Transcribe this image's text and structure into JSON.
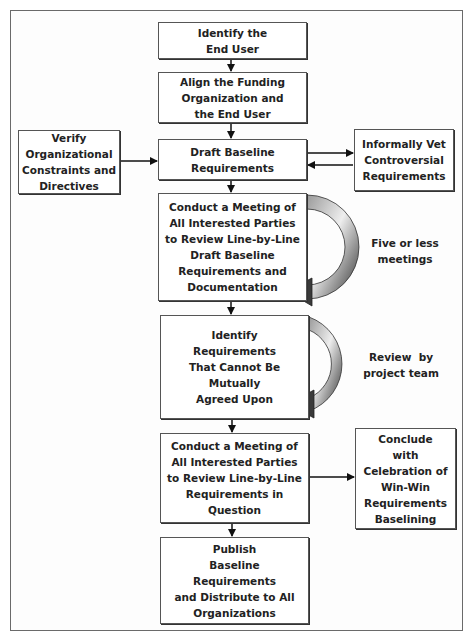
{
  "diagram": {
    "type": "flowchart",
    "main_steps": [
      {
        "id": "identify-end-user",
        "lines": [
          "Identify the",
          "End User"
        ]
      },
      {
        "id": "align-funding",
        "lines": [
          "Align the Funding",
          "Organization and",
          "the End User"
        ]
      },
      {
        "id": "draft-baseline",
        "lines": [
          "Draft Baseline",
          "Requirements"
        ]
      },
      {
        "id": "conduct-meeting-review",
        "lines": [
          "Conduct a Meeting of",
          "All Interested Parties",
          "to Review Line-by-Line",
          "Draft Baseline",
          "Requirements and",
          "Documentation"
        ]
      },
      {
        "id": "identify-disagreements",
        "lines": [
          "Identify",
          "Requirements",
          "That Cannot Be",
          "Mutually",
          "Agreed Upon"
        ]
      },
      {
        "id": "conduct-meeting-question",
        "lines": [
          "Conduct a Meeting of",
          "All Interested Parties",
          "to Review Line-by-Line",
          "Requirements in",
          "Question"
        ]
      },
      {
        "id": "publish-baseline",
        "lines": [
          "Publish",
          "Baseline",
          "Requirements",
          "and Distribute to All",
          "Organizations"
        ]
      }
    ],
    "side_steps": [
      {
        "id": "verify-constraints",
        "lines": [
          "Verify",
          "Organizational",
          "Constraints and",
          "Directives"
        ],
        "connects_to": "draft-baseline",
        "direction": "into"
      },
      {
        "id": "informally-vet",
        "lines": [
          "Informally Vet",
          "Controversial",
          "Requirements"
        ],
        "connects_to": "draft-baseline",
        "direction": "bidirectional"
      },
      {
        "id": "conclude-celebration",
        "lines": [
          "Conclude",
          "with",
          "Celebration of",
          "Win-Win",
          "Requirements",
          "Baselining"
        ],
        "connects_from": "conduct-meeting-question",
        "direction": "out"
      }
    ],
    "loop_notes": [
      {
        "id": "five-or-less",
        "lines": [
          "Five or less",
          "meetings"
        ],
        "attached_to": "conduct-meeting-review"
      },
      {
        "id": "review-by-team",
        "lines": [
          "Review  by",
          "project team"
        ],
        "attached_to": "identify-disagreements"
      }
    ],
    "colors": {
      "border": "#555555",
      "text": "#222222",
      "loop_arrow_light": "#d8d8d8",
      "loop_arrow_dark": "#3a3a3a"
    }
  }
}
